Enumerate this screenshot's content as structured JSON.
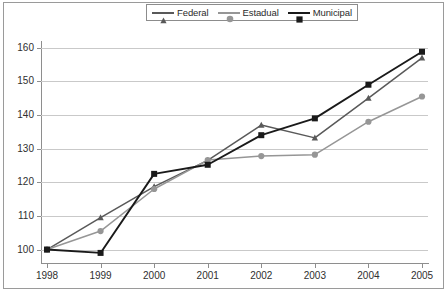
{
  "chart_data": {
    "type": "line",
    "title": "",
    "subtitle": "",
    "xlabel": "",
    "ylabel": "",
    "categories": [
      "1998",
      "1999",
      "2000",
      "2001",
      "2002",
      "2003",
      "2004",
      "2005"
    ],
    "x": [
      1998,
      1999,
      2000,
      2001,
      2002,
      2003,
      2004,
      2005
    ],
    "series": [
      {
        "name": "Federal",
        "color": "#595959",
        "marker": "triangle",
        "values": [
          100,
          109.5,
          118.7,
          126.5,
          137.0,
          133.2,
          145.0,
          157.0
        ]
      },
      {
        "name": "Estadual",
        "color": "#969696",
        "marker": "circle",
        "values": [
          100,
          105.5,
          118.0,
          126.6,
          127.8,
          128.2,
          138.0,
          145.5
        ]
      },
      {
        "name": "Municipal",
        "color": "#1a1a1a",
        "marker": "square",
        "values": [
          100,
          99.0,
          122.5,
          125.2,
          134.0,
          139.0,
          149.0,
          158.8
        ]
      }
    ],
    "ylim": [
      96,
      162
    ],
    "yticks": [
      100,
      110,
      120,
      130,
      140,
      150,
      160
    ],
    "ytick_labels": [
      "100",
      "110",
      "120",
      "130",
      "140",
      "150",
      "160"
    ],
    "grid": true,
    "grid_axis": "y",
    "legend_position": "top-center",
    "legend_entries": [
      "Federal",
      "Estadual",
      "Municipal"
    ]
  },
  "style": {
    "frame_color": "#9a9a9a",
    "axis_color": "#8e8e8e",
    "grid_color": "#c9c9c9",
    "background": "#ffffff",
    "text_color": "#2f2f2f"
  }
}
